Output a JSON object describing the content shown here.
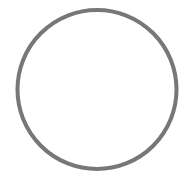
{
  "figure": {
    "shape": "circle-outline",
    "stroke_color": "#777777",
    "fill_color": "#ffffff",
    "background": "#ffffff"
  }
}
